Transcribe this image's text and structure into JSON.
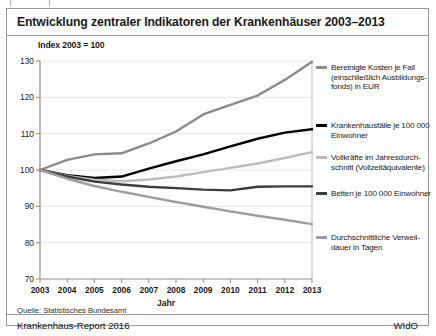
{
  "figure": {
    "title": "Entwicklung zentraler Indikatoren der Krankenhäuser 2003–2013",
    "index_note": "Index 2003 = 100",
    "source": "Quelle: Statistisches Bundesamt",
    "report": "Krankenhaus-Report 2016",
    "publisher": "WIdO"
  },
  "chart_data": {
    "type": "line",
    "title": "Entwicklung zentraler Indikatoren der Krankenhäuser 2003–2013",
    "subtitle": "Index 2003 = 100",
    "xlabel": "Jahr",
    "ylabel": "Index 2003 = 100",
    "x": [
      2003,
      2004,
      2005,
      2006,
      2007,
      2008,
      2009,
      2010,
      2011,
      2012,
      2013
    ],
    "xlim": [
      2003,
      2013
    ],
    "ylim": [
      70,
      130
    ],
    "yticks": [
      70,
      80,
      90,
      100,
      110,
      120,
      130
    ],
    "xticks": [
      "2003",
      "2004",
      "2005",
      "2006",
      "2007",
      "2008",
      "2009",
      "2010",
      "2011",
      "2012",
      "2013"
    ],
    "grid": "horizontal",
    "legend_position": "right",
    "series": [
      {
        "name": "Bereinigte Kosten je Fall (einschließlich Ausbildungsfonds) in EUR",
        "color": "#8a8a8a",
        "width": 2.4,
        "values": [
          100.0,
          102.8,
          104.3,
          104.6,
          107.3,
          110.6,
          115.3,
          117.9,
          120.5,
          124.8,
          129.8
        ]
      },
      {
        "name": "Krankenhausfälle je 100 000 Einwohner",
        "color": "#000000",
        "width": 2.4,
        "values": [
          100.0,
          98.6,
          97.8,
          98.2,
          100.4,
          102.4,
          104.3,
          106.5,
          108.6,
          110.3,
          111.2
        ]
      },
      {
        "name": "Vollkräfte im Jahresdurchschnitt (Vollzeitäquivalente)",
        "color": "#bdbdbd",
        "width": 2.4,
        "values": [
          100.0,
          98.4,
          97.3,
          96.9,
          97.4,
          98.2,
          99.4,
          100.6,
          101.8,
          103.3,
          104.9
        ]
      },
      {
        "name": "Betten je 100 000 Einwohner",
        "color": "#3d3d3d",
        "width": 2.4,
        "values": [
          100.0,
          98.2,
          96.8,
          96.0,
          95.4,
          95.0,
          94.6,
          94.4,
          95.4,
          95.5,
          95.5
        ]
      },
      {
        "name": "Durchschnittliche Verweildauer in Tagen",
        "color": "#9e9e9e",
        "width": 2.4,
        "values": [
          100.0,
          97.6,
          95.6,
          94.0,
          92.6,
          91.2,
          89.9,
          88.6,
          87.4,
          86.3,
          85.1
        ]
      }
    ],
    "legend_entries": [
      {
        "label_lines": [
          "Bereinigte Kosten je Fall",
          "(einschließlich Ausbildungs-",
          "fonds) in EUR"
        ],
        "color": "#8a8a8a"
      },
      {
        "label_lines": [
          "Krankenhausfälle je 100 000",
          "Einwohner"
        ],
        "color": "#000000"
      },
      {
        "label_lines": [
          "Vollkräfte im Jahresdurch-",
          "schnitt (Vollzeitäquivalente)"
        ],
        "color": "#bdbdbd"
      },
      {
        "label_lines": [
          "Betten je 100 000 Einwohner"
        ],
        "color": "#3d3d3d"
      },
      {
        "label_lines": [
          "Durchschnittliche Verweil-",
          "dauer in Tagen"
        ],
        "color": "#9e9e9e"
      }
    ]
  }
}
